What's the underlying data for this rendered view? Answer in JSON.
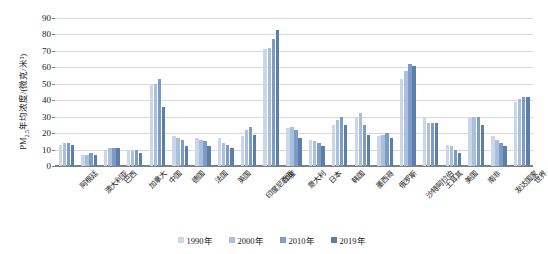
{
  "chart_data": {
    "type": "bar",
    "title": "",
    "xlabel": "",
    "ylabel": "PM2.5年均浓度/(微克/米³)",
    "ylabel_prefix": "PM",
    "ylabel_sub": "2.5",
    "ylabel_suffix": "年均浓度/(微克/米³)",
    "ylim": [
      0,
      90
    ],
    "ytick_step": 10,
    "yticks": [
      0,
      10,
      20,
      30,
      40,
      50,
      60,
      70,
      80,
      90
    ],
    "grid": true,
    "legend_position": "bottom",
    "categories": [
      "阿根廷",
      "澳大利亚",
      "巴西",
      "加拿大",
      "中国",
      "德国",
      "法国",
      "英国",
      "印度尼西亚",
      "印度",
      "意大利",
      "日本",
      "韩国",
      "墨西哥",
      "俄罗斯",
      "沙特阿拉伯",
      "土耳其",
      "美国",
      "南非",
      "发达国家",
      "世界"
    ],
    "series": [
      {
        "name": "1990年",
        "color": "#c9d7e9",
        "values": [
          13,
          7,
          10,
          9,
          49,
          18,
          17,
          17,
          18,
          71,
          23,
          16,
          25,
          29,
          18,
          53,
          29,
          13,
          29,
          18,
          39
        ]
      },
      {
        "name": "2000年",
        "color": "#aabfdb",
        "values": [
          14,
          7,
          11,
          9,
          50,
          17,
          16,
          14,
          22,
          72,
          24,
          15,
          28,
          32,
          19,
          58,
          26,
          12,
          30,
          16,
          41
        ]
      },
      {
        "name": "2010年",
        "color": "#7d9cc5",
        "values": [
          14,
          8,
          11,
          10,
          53,
          16,
          15,
          13,
          24,
          77,
          22,
          14,
          30,
          25,
          20,
          62,
          26,
          10,
          30,
          14,
          42
        ]
      },
      {
        "name": "2019年",
        "color": "#5b7fa8",
        "values": [
          13,
          7,
          11,
          8,
          36,
          12,
          12,
          11,
          19,
          83,
          17,
          12,
          25,
          19,
          17,
          61,
          26,
          8,
          25,
          12,
          42
        ]
      }
    ]
  },
  "legend": {
    "items": [
      {
        "label": "1990年",
        "color": "#c9d7e9"
      },
      {
        "label": "2000年",
        "color": "#aabfdb"
      },
      {
        "label": "2010年",
        "color": "#7d9cc5"
      },
      {
        "label": "2019年",
        "color": "#5b7fa8"
      }
    ]
  }
}
